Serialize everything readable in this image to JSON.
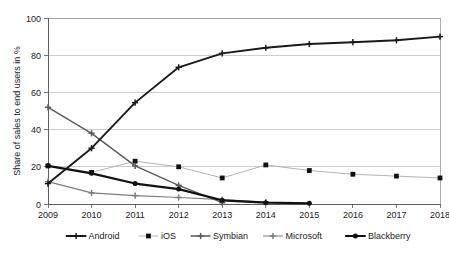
{
  "chart_data": {
    "type": "line",
    "title": "",
    "xlabel": "",
    "ylabel": "Share of sales to end users in %",
    "categories": [
      "2009",
      "2010",
      "2011",
      "2012",
      "2013",
      "2014",
      "2015",
      "2016",
      "2017",
      "2018"
    ],
    "x": [
      2009,
      2010,
      2011,
      2012,
      2013,
      2014,
      2015,
      2016,
      2017,
      2018
    ],
    "ylim": [
      0,
      100
    ],
    "yticks": [
      0,
      20,
      40,
      60,
      80,
      100
    ],
    "ytick_labels": [
      "0",
      "20",
      "40",
      "60",
      "80",
      "100"
    ],
    "xlim": [
      2009,
      2018
    ],
    "grid": "horizontal",
    "legend_position": "bottom",
    "series": [
      {
        "name": "Android",
        "marker": "plus",
        "color": "#1a1a1a",
        "line_width": 1.9,
        "values": [
          11,
          30,
          54.5,
          73.5,
          81,
          84,
          86,
          87,
          88,
          90
        ]
      },
      {
        "name": "iOS",
        "marker": "square",
        "color": "#b4b4b4",
        "line_width": 1.0,
        "values": [
          20.5,
          17,
          23,
          20,
          14,
          21,
          18,
          16,
          15,
          14
        ]
      },
      {
        "name": "Symbian",
        "marker": "plus",
        "color": "#5a5a5a",
        "line_width": 1.4,
        "values": [
          52,
          38,
          20.5,
          10,
          0.7,
          null,
          null,
          null,
          null,
          null
        ]
      },
      {
        "name": "Microsoft",
        "marker": "plus",
        "color": "#7d7d7d",
        "line_width": 1.2,
        "values": [
          12,
          6,
          4.5,
          3.5,
          2.3,
          1.0,
          null,
          null,
          null,
          null
        ]
      },
      {
        "name": "Blackberry",
        "marker": "circle",
        "color": "#111111",
        "line_width": 2.2,
        "values": [
          20.5,
          16.5,
          11,
          8,
          2,
          0.7,
          0.4,
          null,
          null,
          null
        ]
      }
    ]
  },
  "legend": {
    "items": [
      {
        "label": "Android"
      },
      {
        "label": "iOS"
      },
      {
        "label": "Symbian"
      },
      {
        "label": "Microsoft"
      },
      {
        "label": "Blackberry"
      }
    ]
  },
  "axes": {
    "y_title": "Share of sales to end users in %"
  }
}
